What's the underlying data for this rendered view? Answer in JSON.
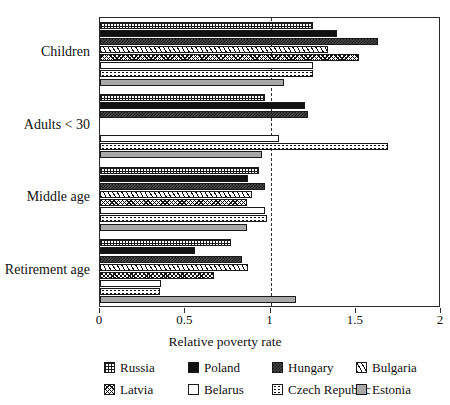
{
  "chart_data": {
    "type": "bar",
    "orientation": "horizontal",
    "title": "",
    "xlabel": "Relative poverty rate",
    "ylabel": "",
    "xlim": [
      0,
      2
    ],
    "ylim": null,
    "grid": false,
    "xticks": [
      0,
      0.5,
      1,
      1.5,
      2
    ],
    "xticklabels": [
      "0",
      "0.5",
      "1",
      "1.5",
      "2"
    ],
    "reference_line": 1,
    "legend_position": "below",
    "categories": [
      "Children",
      "Adults < 30",
      "Middle age",
      "Retirement age"
    ],
    "series": [
      {
        "name": "Russia",
        "pattern": "grid-dotted",
        "values": [
          1.25,
          0.97,
          0.93,
          0.77
        ]
      },
      {
        "name": "Poland",
        "pattern": "solid-black",
        "values": [
          1.39,
          1.2,
          0.87,
          0.56
        ]
      },
      {
        "name": "Hungary",
        "pattern": "dark-checker",
        "values": [
          1.63,
          1.22,
          0.97,
          0.83
        ]
      },
      {
        "name": "Bulgaria",
        "pattern": "diagonal-lines",
        "values": [
          1.34,
          0,
          0.89,
          0.87
        ]
      },
      {
        "name": "Latvia",
        "pattern": "cross-zigzag",
        "values": [
          1.52,
          0,
          0.86,
          0.67
        ]
      },
      {
        "name": "Belarus",
        "pattern": "white-blank",
        "values": [
          1.25,
          1.05,
          0.97,
          0.36
        ]
      },
      {
        "name": "Czech Republic",
        "pattern": "sparse-dots",
        "values": [
          1.25,
          1.69,
          0.98,
          0.35
        ]
      },
      {
        "name": "Estonia",
        "pattern": "solid-gray",
        "values": [
          1.08,
          0.95,
          0.86,
          1.15
        ]
      }
    ]
  },
  "axis": {
    "x_title": "Relative poverty rate",
    "tick_labels": [
      "0",
      "0.5",
      "1",
      "1.5",
      "2"
    ],
    "category_labels": [
      "Children",
      "Adults < 30",
      "Middle age",
      "Retirement age"
    ]
  },
  "legend": {
    "entries": [
      {
        "label": "Russia",
        "color": "#ffffff"
      },
      {
        "label": "Poland",
        "color": "#111111"
      },
      {
        "label": "Hungary",
        "color": "#4a4a4a"
      },
      {
        "label": "Bulgaria",
        "color": "#ffffff"
      },
      {
        "label": "Latvia",
        "color": "#ffffff"
      },
      {
        "label": "Belarus",
        "color": "#ffffff"
      },
      {
        "label": "Czech Republic",
        "color": "#ffffff"
      },
      {
        "label": "Estonia",
        "color": "#a8a8a8"
      }
    ]
  },
  "colors": {
    "frame": "#2a2a2a",
    "text": "#111111",
    "background": "#ffffff",
    "reference_line": "#333333"
  }
}
